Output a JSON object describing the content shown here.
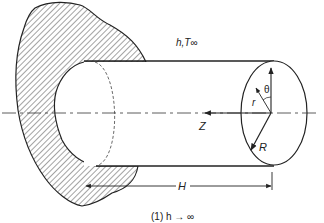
{
  "diagram": {
    "labels": {
      "convection": "h,T∞",
      "theta": "θ",
      "radius_var": "r",
      "axis_z": "Z",
      "radius": "R",
      "length": "H",
      "caption": "(1) h → ∞"
    },
    "colors": {
      "line": "#222222",
      "background": "#ffffff"
    }
  }
}
